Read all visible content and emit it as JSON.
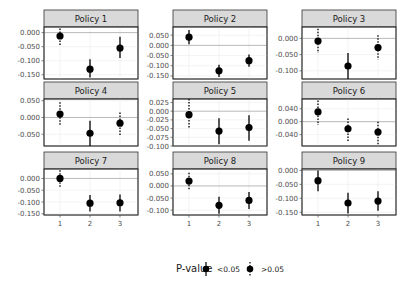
{
  "chart_data": {
    "type": "scatter",
    "subtype": "faceted point-range (coefficient plot)",
    "layout": {
      "rows": 3,
      "cols": 3,
      "grid": true,
      "legend_position": "bottom"
    },
    "x_categories": [
      "1",
      "2",
      "3"
    ],
    "legend": {
      "title": "P-value",
      "entries": [
        {
          "label": "<0.05",
          "line": "solid"
        },
        {
          "label": ">0.05",
          "line": "dotted"
        }
      ]
    },
    "panels": [
      {
        "title": "Policy 1",
        "ylim": [
          -0.165,
          0.02
        ],
        "yticks": [
          0.0,
          -0.05,
          -0.1,
          -0.15
        ],
        "yticklabels": [
          "0.000",
          "-0.050",
          "-0.100",
          "-0.150"
        ],
        "points": [
          {
            "x": "1",
            "y": -0.012,
            "lo": -0.045,
            "hi": 0.015,
            "sig": false
          },
          {
            "x": "2",
            "y": -0.13,
            "lo": -0.16,
            "hi": -0.095,
            "sig": true
          },
          {
            "x": "3",
            "y": -0.055,
            "lo": -0.09,
            "hi": -0.015,
            "sig": true
          }
        ]
      },
      {
        "title": "Policy 2",
        "ylim": [
          -0.165,
          0.09
        ],
        "yticks": [
          0.05,
          0.0,
          -0.05,
          -0.1,
          -0.15
        ],
        "yticklabels": [
          "0.050",
          "0.000",
          "-0.050",
          "-0.100",
          "-0.150"
        ],
        "points": [
          {
            "x": "1",
            "y": 0.04,
            "lo": 0.005,
            "hi": 0.075,
            "sig": true
          },
          {
            "x": "2",
            "y": -0.125,
            "lo": -0.155,
            "hi": -0.095,
            "sig": true
          },
          {
            "x": "3",
            "y": -0.075,
            "lo": -0.105,
            "hi": -0.045,
            "sig": true
          }
        ]
      },
      {
        "title": "Policy 3",
        "ylim": [
          -0.125,
          0.035
        ],
        "yticks": [
          0.0,
          -0.05,
          -0.1
        ],
        "yticklabels": [
          "0.000",
          "-0.050",
          "-0.100"
        ],
        "points": [
          {
            "x": "1",
            "y": -0.008,
            "lo": -0.045,
            "hi": 0.03,
            "sig": false
          },
          {
            "x": "2",
            "y": -0.085,
            "lo": -0.125,
            "hi": -0.045,
            "sig": true
          },
          {
            "x": "3",
            "y": -0.028,
            "lo": -0.065,
            "hi": 0.01,
            "sig": false
          }
        ]
      },
      {
        "title": "Policy 4",
        "ylim": [
          -0.085,
          0.055
        ],
        "yticks": [
          0.05,
          0.0,
          -0.05
        ],
        "yticklabels": [
          "0.050",
          "0.000",
          "-0.050"
        ],
        "points": [
          {
            "x": "1",
            "y": 0.01,
            "lo": -0.025,
            "hi": 0.045,
            "sig": false
          },
          {
            "x": "2",
            "y": -0.047,
            "lo": -0.085,
            "hi": -0.01,
            "sig": true
          },
          {
            "x": "3",
            "y": -0.017,
            "lo": -0.052,
            "hi": 0.015,
            "sig": false
          }
        ]
      },
      {
        "title": "Policy 5",
        "ylim": [
          -0.1,
          0.035
        ],
        "yticks": [
          0.025,
          0.0,
          -0.025,
          -0.05,
          -0.075,
          -0.1
        ],
        "yticklabels": [
          "0.025",
          "0.000",
          "-0.025",
          "-0.050",
          "-0.075",
          "-0.100"
        ],
        "points": [
          {
            "x": "1",
            "y": -0.01,
            "lo": -0.05,
            "hi": 0.035,
            "sig": false
          },
          {
            "x": "2",
            "y": -0.057,
            "lo": -0.095,
            "hi": -0.02,
            "sig": true
          },
          {
            "x": "3",
            "y": -0.047,
            "lo": -0.085,
            "hi": -0.012,
            "sig": true
          }
        ]
      },
      {
        "title": "Policy 6",
        "ylim": [
          -0.075,
          0.07
        ],
        "yticks": [
          0.04,
          0.0,
          -0.04
        ],
        "yticklabels": [
          "0.040",
          "0.000",
          "-0.040"
        ],
        "points": [
          {
            "x": "1",
            "y": 0.03,
            "lo": -0.01,
            "hi": 0.065,
            "sig": false
          },
          {
            "x": "2",
            "y": -0.022,
            "lo": -0.06,
            "hi": 0.01,
            "sig": false
          },
          {
            "x": "3",
            "y": -0.032,
            "lo": -0.07,
            "hi": 0.0,
            "sig": false
          }
        ]
      },
      {
        "title": "Policy 7",
        "ylim": [
          -0.155,
          0.04
        ],
        "yticks": [
          0.0,
          -0.05,
          -0.1,
          -0.15
        ],
        "yticklabels": [
          "0.000",
          "-0.050",
          "-0.100",
          "-0.150"
        ],
        "points": [
          {
            "x": "1",
            "y": 0.0,
            "lo": -0.035,
            "hi": 0.035,
            "sig": false
          },
          {
            "x": "2",
            "y": -0.105,
            "lo": -0.14,
            "hi": -0.07,
            "sig": true
          },
          {
            "x": "3",
            "y": -0.103,
            "lo": -0.14,
            "hi": -0.068,
            "sig": true
          }
        ]
      },
      {
        "title": "Policy 8",
        "ylim": [
          -0.12,
          0.07
        ],
        "yticks": [
          0.05,
          0.0,
          -0.05,
          -0.1
        ],
        "yticklabels": [
          "0.050",
          "0.000",
          "-0.050",
          "-0.100"
        ],
        "points": [
          {
            "x": "1",
            "y": 0.02,
            "lo": -0.015,
            "hi": 0.055,
            "sig": false
          },
          {
            "x": "2",
            "y": -0.08,
            "lo": -0.115,
            "hi": -0.045,
            "sig": true
          },
          {
            "x": "3",
            "y": -0.06,
            "lo": -0.095,
            "hi": -0.025,
            "sig": true
          }
        ]
      },
      {
        "title": "Policy 9",
        "ylim": [
          -0.16,
          0.005
        ],
        "yticks": [
          0.0,
          -0.05,
          -0.1,
          -0.15
        ],
        "yticklabels": [
          "0.000",
          "-0.050",
          "-0.100",
          "-0.150"
        ],
        "points": [
          {
            "x": "1",
            "y": -0.037,
            "lo": -0.075,
            "hi": 0.0,
            "sig": true
          },
          {
            "x": "2",
            "y": -0.117,
            "lo": -0.155,
            "hi": -0.08,
            "sig": true
          },
          {
            "x": "3",
            "y": -0.11,
            "lo": -0.145,
            "hi": -0.075,
            "sig": true
          }
        ]
      }
    ]
  },
  "colors": {
    "point": "#000000",
    "strip_fill": "#d9d9d9",
    "panel_border": "#333333",
    "grid": "#ebebeb",
    "zero_line": "#999999"
  }
}
